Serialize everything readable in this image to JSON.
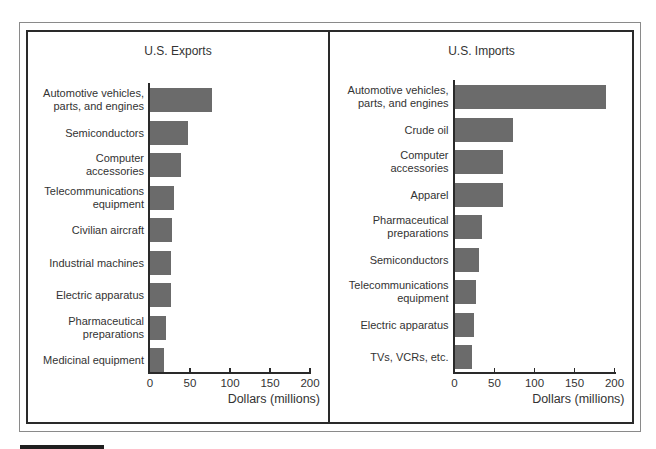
{
  "figure": {
    "left_panel_title": "U.S. Exports",
    "right_panel_title": "U.S. Imports",
    "bar_color": "#6b6b6b",
    "axis_color": "#2a2a2a"
  },
  "chart_data": [
    {
      "type": "bar",
      "orientation": "horizontal",
      "title": "U.S. Exports",
      "xlabel": "Dollars (millions)",
      "ylabel": "",
      "xlim": [
        0,
        200
      ],
      "xticks": [
        "0",
        "50",
        "100",
        "150",
        "200"
      ],
      "grid": false,
      "categories": [
        "Automotive vehicles, parts, and engines",
        "Semiconductors",
        "Computer accessories",
        "Telecommunications equipment",
        "Civilian aircraft",
        "Industrial machines",
        "Electric apparatus",
        "Pharmaceutical preparations",
        "Medicinal equipment"
      ],
      "category_lines": [
        [
          "Automotive vehicles,",
          "parts, and engines"
        ],
        [
          "Semiconductors"
        ],
        [
          "Computer",
          "accessories"
        ],
        [
          "Telecommunications",
          "equipment"
        ],
        [
          "Civilian aircraft"
        ],
        [
          "Industrial machines"
        ],
        [
          "Electric apparatus"
        ],
        [
          "Pharmaceutical",
          "preparations"
        ],
        [
          "Medicinal equipment"
        ]
      ],
      "values": [
        77,
        47,
        39,
        30,
        27,
        26,
        26,
        20,
        18
      ]
    },
    {
      "type": "bar",
      "orientation": "horizontal",
      "title": "U.S. Imports",
      "xlabel": "Dollars (millions)",
      "ylabel": "",
      "xlim": [
        0,
        200
      ],
      "xticks": [
        "0",
        "50",
        "100",
        "150",
        "200"
      ],
      "grid": false,
      "categories": [
        "Automotive vehicles, parts, and engines",
        "Crude oil",
        "Computer accessories",
        "Apparel",
        "Pharmaceutical preparations",
        "Semiconductors",
        "Telecommunications equipment",
        "Electric apparatus",
        "TVs, VCRs, etc."
      ],
      "category_lines": [
        [
          "Automotive vehicles,",
          "parts, and engines"
        ],
        [
          "Crude oil"
        ],
        [
          "Computer",
          "accessories"
        ],
        [
          "Apparel"
        ],
        [
          "Pharmaceutical",
          "preparations"
        ],
        [
          "Semiconductors"
        ],
        [
          "Telecommunications",
          "equipment"
        ],
        [
          "Electric apparatus"
        ],
        [
          "TVs, VCRs, etc."
        ]
      ],
      "values": [
        189,
        73,
        61,
        60,
        34,
        31,
        27,
        24,
        22
      ]
    }
  ]
}
